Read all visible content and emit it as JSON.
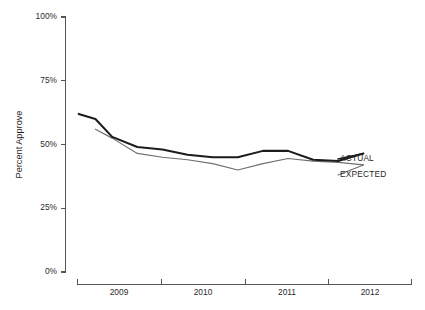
{
  "chart_data": {
    "type": "line",
    "title": "",
    "xlabel": "",
    "ylabel": "Percent Approve",
    "ylim": [
      0,
      100
    ],
    "xlim": [
      2008.5,
      2012.5
    ],
    "grid": false,
    "legend_position": "inline-right-end",
    "y_ticks": [
      0,
      25,
      50,
      75,
      100
    ],
    "y_tick_labels": [
      "0%",
      "25%",
      "50%",
      "75%",
      "100%"
    ],
    "x_tick_labels": [
      "2009",
      "2010",
      "2011",
      "2012"
    ],
    "x_tick_boundaries": [
      2008.5,
      2009.5,
      2010.5,
      2011.5,
      2012.5
    ],
    "series": [
      {
        "name": "ACTUAL",
        "color": "#1c1c1c",
        "x": [
          2008.52,
          2008.72,
          2008.92,
          2009.22,
          2009.52,
          2009.82,
          2010.12,
          2010.42,
          2010.72,
          2011.02,
          2011.32,
          2011.62,
          2011.92
        ],
        "values": [
          62,
          60,
          53,
          49,
          48,
          46,
          45,
          45,
          47.5,
          47.5,
          44,
          43.5,
          46.5
        ]
      },
      {
        "name": "EXPECTED",
        "color": "#6f6f6f",
        "x": [
          2008.72,
          2008.92,
          2009.22,
          2009.52,
          2009.82,
          2010.12,
          2010.42,
          2010.72,
          2011.02,
          2011.32,
          2011.62,
          2011.92
        ],
        "values": [
          56,
          52.5,
          46.5,
          45,
          44,
          42.5,
          40,
          42.5,
          44.5,
          43.5,
          43,
          42
        ]
      }
    ]
  },
  "labels": {
    "y_axis_title": "Percent Approve",
    "series_actual": "ACTUAL",
    "series_expected": "EXPECTED",
    "y_tick_100": "100%",
    "y_tick_75": "75%",
    "y_tick_50": "50%",
    "y_tick_25": "25%",
    "y_tick_0": "0%",
    "x_tick_2009": "2009",
    "x_tick_2010": "2010",
    "x_tick_2011": "2011",
    "x_tick_2012": "2012"
  }
}
